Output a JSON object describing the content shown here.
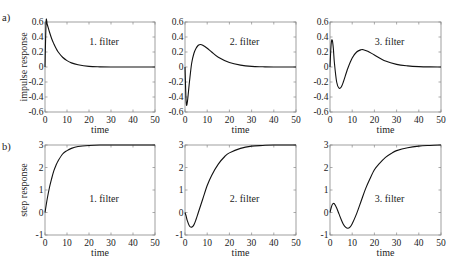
{
  "figure": {
    "rows": [
      {
        "panel_label": "a)",
        "ylabel": "impulse response"
      },
      {
        "panel_label": "b)",
        "ylabel": "step response"
      }
    ]
  },
  "chart_data": [
    {
      "type": "line",
      "row": "a",
      "annotation": "1. filter",
      "xlabel": "time",
      "ylabel": "impulse response",
      "xlim": [
        0,
        50
      ],
      "ylim": [
        -0.6,
        0.6
      ],
      "xticks": [
        "0",
        "10",
        "20",
        "30",
        "40",
        "50"
      ],
      "yticks": [
        "-0.6",
        "-0.4",
        "-0.2",
        "0",
        "0.2",
        "0.4",
        "0.6"
      ],
      "grid": false,
      "x": [
        0,
        0.5,
        1,
        2,
        3,
        4,
        5,
        6,
        8,
        10,
        12,
        15,
        20,
        25,
        30,
        40,
        50
      ],
      "y": [
        0,
        0.6,
        0.57,
        0.47,
        0.38,
        0.31,
        0.25,
        0.2,
        0.13,
        0.085,
        0.055,
        0.03,
        0.008,
        0.002,
        0,
        0,
        0
      ]
    },
    {
      "type": "line",
      "row": "a",
      "annotation": "2. filter",
      "xlabel": "time",
      "ylabel": "",
      "xlim": [
        0,
        50
      ],
      "ylim": [
        -0.6,
        0.6
      ],
      "xticks": [
        "0",
        "10",
        "20",
        "30",
        "40",
        "50"
      ],
      "yticks": [
        "-0.6",
        "-0.4",
        "-0.2",
        "0",
        "0.2",
        "0.4",
        "0.6"
      ],
      "grid": false,
      "x": [
        0,
        0.5,
        1,
        2,
        3,
        4,
        5,
        6,
        7,
        8,
        10,
        12,
        15,
        20,
        25,
        30,
        35,
        40,
        50
      ],
      "y": [
        0,
        -0.45,
        -0.48,
        -0.2,
        0.05,
        0.18,
        0.25,
        0.29,
        0.3,
        0.29,
        0.25,
        0.2,
        0.13,
        0.06,
        0.025,
        0.008,
        0.003,
        0,
        0
      ]
    },
    {
      "type": "line",
      "row": "a",
      "annotation": "3. filter",
      "xlabel": "time",
      "ylabel": "",
      "xlim": [
        0,
        50
      ],
      "ylim": [
        -0.6,
        0.6
      ],
      "xticks": [
        "0",
        "10",
        "20",
        "30",
        "40",
        "50"
      ],
      "yticks": [
        "-0.6",
        "-0.4",
        "-0.2",
        "0",
        "0.2",
        "0.4",
        "0.6"
      ],
      "grid": false,
      "x": [
        0,
        0.5,
        1,
        1.5,
        2,
        3,
        4,
        5,
        6,
        8,
        10,
        12,
        14,
        15,
        17,
        20,
        25,
        30,
        35,
        40,
        45,
        50
      ],
      "y": [
        0,
        0.3,
        0.36,
        0.25,
        0.05,
        -0.2,
        -0.28,
        -0.27,
        -0.2,
        -0.02,
        0.12,
        0.2,
        0.23,
        0.23,
        0.21,
        0.16,
        0.08,
        0.035,
        0.015,
        0.005,
        0.001,
        0
      ]
    },
    {
      "type": "line",
      "row": "b",
      "annotation": "1. filter",
      "xlabel": "time",
      "ylabel": "step response",
      "xlim": [
        0,
        50
      ],
      "ylim": [
        -1,
        3
      ],
      "xticks": [
        "0",
        "10",
        "20",
        "30",
        "40",
        "50"
      ],
      "yticks": [
        "-1",
        "0",
        "1",
        "2",
        "3"
      ],
      "grid": false,
      "x": [
        0,
        1,
        2,
        3,
        4,
        5,
        6,
        8,
        10,
        12,
        15,
        20,
        25,
        30,
        40,
        50
      ],
      "y": [
        0,
        0.6,
        1.1,
        1.5,
        1.85,
        2.1,
        2.3,
        2.6,
        2.75,
        2.85,
        2.93,
        2.98,
        3.0,
        3.0,
        3.0,
        3.0
      ]
    },
    {
      "type": "line",
      "row": "b",
      "annotation": "2. filter",
      "xlabel": "time",
      "ylabel": "",
      "xlim": [
        0,
        50
      ],
      "ylim": [
        -1,
        3
      ],
      "xticks": [
        "0",
        "10",
        "20",
        "30",
        "40",
        "50"
      ],
      "yticks": [
        "-1",
        "0",
        "1",
        "2",
        "3"
      ],
      "grid": false,
      "x": [
        0,
        0.5,
        1,
        2,
        3,
        4,
        5,
        6,
        8,
        10,
        12,
        15,
        18,
        20,
        25,
        30,
        35,
        40,
        50
      ],
      "y": [
        0,
        -0.15,
        -0.35,
        -0.6,
        -0.65,
        -0.55,
        -0.3,
        0.0,
        0.6,
        1.2,
        1.65,
        2.15,
        2.5,
        2.65,
        2.85,
        2.95,
        2.98,
        3.0,
        3.0
      ]
    },
    {
      "type": "line",
      "row": "b",
      "annotation": "3. filter",
      "xlabel": "time",
      "ylabel": "",
      "xlim": [
        0,
        50
      ],
      "ylim": [
        -1,
        3
      ],
      "xticks": [
        "0",
        "10",
        "20",
        "30",
        "40",
        "50"
      ],
      "yticks": [
        "-1",
        "0",
        "1",
        "2",
        "3"
      ],
      "grid": false,
      "x": [
        0,
        0.5,
        1,
        1.5,
        2,
        3,
        4,
        5,
        6,
        7,
        8,
        9,
        10,
        12,
        14,
        16,
        18,
        20,
        22,
        25,
        28,
        30,
        35,
        40,
        45,
        50
      ],
      "y": [
        0,
        0.2,
        0.35,
        0.4,
        0.38,
        0.2,
        -0.05,
        -0.3,
        -0.52,
        -0.65,
        -0.7,
        -0.65,
        -0.5,
        -0.05,
        0.5,
        1.05,
        1.5,
        1.9,
        2.15,
        2.45,
        2.65,
        2.75,
        2.88,
        2.95,
        2.98,
        3.0
      ]
    }
  ]
}
